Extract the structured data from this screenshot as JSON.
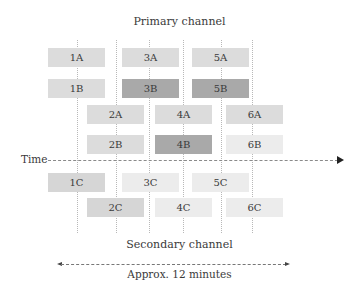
{
  "title_top": "Primary channel",
  "title_bottom": "Secondary channel",
  "time_label": "Time",
  "duration_label": "Approx. 12 minutes",
  "colors": {
    "light": "#dcdcdc",
    "dark": "#a9a9a9",
    "lighter": "#ececec",
    "medium_light": "#d6d6d6"
  },
  "boxes": [
    {
      "label": "1A",
      "x": 48,
      "y": 48,
      "shade": "light"
    },
    {
      "label": "3A",
      "x": 122,
      "y": 48,
      "shade": "light"
    },
    {
      "label": "5A",
      "x": 192,
      "y": 48,
      "shade": "light"
    },
    {
      "label": "1B",
      "x": 48,
      "y": 79,
      "shade": "light"
    },
    {
      "label": "3B",
      "x": 122,
      "y": 79,
      "shade": "dark"
    },
    {
      "label": "5B",
      "x": 192,
      "y": 79,
      "shade": "dark"
    },
    {
      "label": "2A",
      "x": 87,
      "y": 105,
      "shade": "light"
    },
    {
      "label": "4A",
      "x": 155,
      "y": 105,
      "shade": "light"
    },
    {
      "label": "6A",
      "x": 226,
      "y": 105,
      "shade": "light"
    },
    {
      "label": "2B",
      "x": 87,
      "y": 135,
      "shade": "light"
    },
    {
      "label": "4B",
      "x": 155,
      "y": 135,
      "shade": "dark"
    },
    {
      "label": "6B",
      "x": 226,
      "y": 135,
      "shade": "lighter"
    },
    {
      "label": "1C",
      "x": 48,
      "y": 173,
      "shade": "medium_light"
    },
    {
      "label": "3C",
      "x": 122,
      "y": 173,
      "shade": "lighter"
    },
    {
      "label": "5C",
      "x": 192,
      "y": 173,
      "shade": "lighter"
    },
    {
      "label": "2C",
      "x": 87,
      "y": 198,
      "shade": "medium_light"
    },
    {
      "label": "4C",
      "x": 155,
      "y": 198,
      "shade": "lighter"
    },
    {
      "label": "6C",
      "x": 226,
      "y": 198,
      "shade": "lighter"
    }
  ],
  "vertical_guides_x": [
    77,
    116,
    149,
    183,
    221,
    252
  ]
}
